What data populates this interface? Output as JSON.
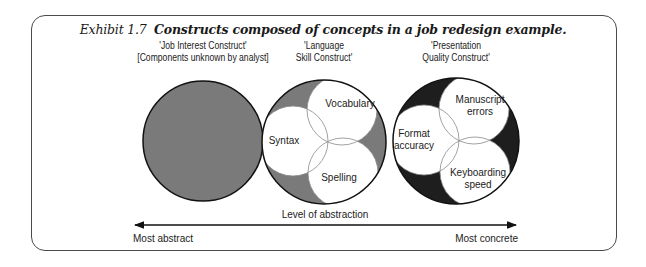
{
  "title": {
    "number": "Exhibit 1.7",
    "caption": "Constructs composed of concepts in a job redesign example."
  },
  "constructs": [
    {
      "name": "job-interest",
      "label_lines": [
        "'Job Interest Construct'",
        "[Components unknown by analyst]"
      ],
      "fill": "#7a7a7a",
      "components": []
    },
    {
      "name": "language-skill",
      "label_lines": [
        "'Language",
        "Skill Construct'"
      ],
      "fill": "#7a7a7a",
      "components": [
        {
          "label_lines": [
            "Vocabulary"
          ]
        },
        {
          "label_lines": [
            "Syntax"
          ]
        },
        {
          "label_lines": [
            "Spelling"
          ]
        }
      ]
    },
    {
      "name": "presentation-quality",
      "label_lines": [
        "'Presentation",
        "Quality Construct'"
      ],
      "fill": "#1e1e1e",
      "components": [
        {
          "label_lines": [
            "Manuscript",
            "errors"
          ]
        },
        {
          "label_lines": [
            "Format",
            "accuracy"
          ]
        },
        {
          "label_lines": [
            "Keyboarding",
            "speed"
          ]
        }
      ]
    }
  ],
  "axis": {
    "label": "Level of abstraction",
    "left_end": "Most abstract",
    "right_end": "Most concrete"
  },
  "colors": {
    "frame": "#4a4a4a",
    "outline": "#111111",
    "inner_fill": "#ffffff",
    "inner_stroke": "#8a8a8a"
  }
}
